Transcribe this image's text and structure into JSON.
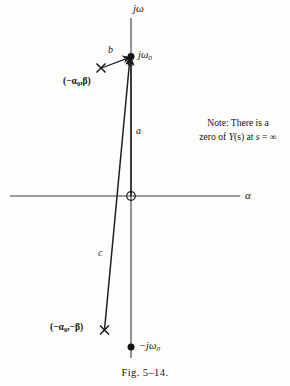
{
  "figure": {
    "caption": "Fig. 5–14.",
    "axes": {
      "vertical_label": "jω",
      "horizontal_label": "α"
    },
    "note": {
      "line1": "Note: There is a",
      "line2_prefix": "zero of ",
      "line2_func": "Y",
      "line2_arg": "(s)",
      "line2_mid": " at ",
      "line2_var": "s",
      "line2_eq": " = ",
      "line2_infinity": "∞"
    },
    "markers": [
      {
        "name": "zero-at-origin",
        "glyph": "circle-open",
        "label": "",
        "x": 131,
        "y": 196
      },
      {
        "name": "zero-upper-imaginary",
        "glyph": "circle-filled",
        "label": "jω",
        "label_sub": "0",
        "x": 131,
        "y": 57
      },
      {
        "name": "zero-lower-imaginary",
        "glyph": "circle-filled",
        "label": "−jω",
        "label_sub": "0",
        "x": 131,
        "y": 347
      },
      {
        "name": "pole-upper-left",
        "glyph": "cross",
        "label": "(−α",
        "label_sub": "0",
        "label_tail": ",β)",
        "x": 101,
        "y": 68
      },
      {
        "name": "pole-lower-left",
        "glyph": "cross",
        "label": "(−α",
        "label_sub": "0",
        "label_tail": ",−β)",
        "x": 104,
        "y": 330
      }
    ],
    "vectors": [
      {
        "name": "vector-a",
        "label": "a",
        "from_x": 131,
        "from_y": 196,
        "to_x": 131,
        "to_y": 60,
        "label_x": 136,
        "label_y": 131
      },
      {
        "name": "vector-b",
        "label": "b",
        "from_x": 101,
        "from_y": 68,
        "to_x": 129,
        "to_y": 58,
        "label_x": 110,
        "label_y": 50
      },
      {
        "name": "vector-c",
        "label": "c",
        "from_x": 104,
        "from_y": 330,
        "to_x": 130,
        "to_y": 60,
        "label_x": 101,
        "label_y": 253
      }
    ],
    "axis_geometry": {
      "v_x": 131,
      "v_top": 18,
      "v_bottom": 358,
      "h_y": 196,
      "h_left": 10,
      "h_right": 240
    }
  }
}
